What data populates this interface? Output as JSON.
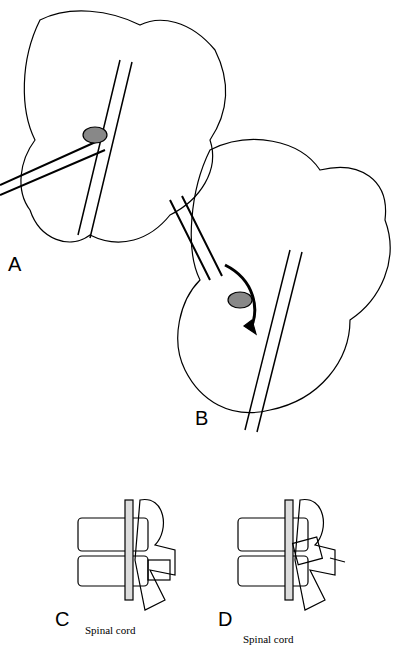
{
  "figure": {
    "panels": [
      {
        "id": "A",
        "label": "A",
        "description": "Vertebra posterior view with rod and instrument removing facet"
      },
      {
        "id": "B",
        "label": "B",
        "description": "Rongeur/instrument with curved arrow indicating motion toward facet"
      },
      {
        "id": "C",
        "label": "C",
        "caption": "Spinal cord",
        "description": "Lateral view of vertebrae with spinal cord"
      },
      {
        "id": "D",
        "label": "D",
        "caption": "Spinal cord",
        "description": "Lateral view with instrument and arrow"
      }
    ],
    "colors": {
      "ink": "#000000",
      "background": "#ffffff",
      "hatch": "#555555"
    }
  }
}
